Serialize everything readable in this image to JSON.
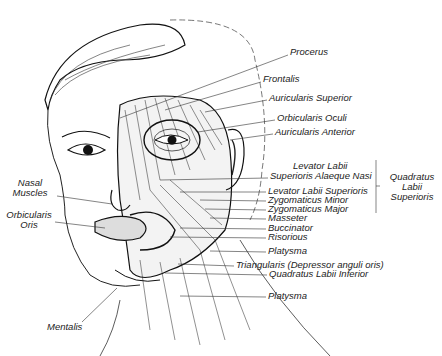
{
  "diagram": {
    "labels_right": [
      {
        "id": "procerus",
        "text": "Procerus",
        "x": 290,
        "y": 50
      },
      {
        "id": "frontalis",
        "text": "Frontalis",
        "x": 263,
        "y": 77
      },
      {
        "id": "auricularis-superior",
        "text": "Auricularis Superior",
        "x": 269,
        "y": 95
      },
      {
        "id": "orbicularis-oculi",
        "text": "Orbicularis Oculi",
        "x": 277,
        "y": 115
      },
      {
        "id": "auricularis-anterior",
        "text": "Auricularis Anterior",
        "x": 275,
        "y": 129
      },
      {
        "id": "levator-labii-line1",
        "text": "Levator Labii",
        "x": 293,
        "y": 163
      },
      {
        "id": "levator-labii-line2",
        "text": "Superioris Alaeque Nasi",
        "x": 270,
        "y": 173
      },
      {
        "id": "levator-labii-superioris",
        "text": "Levator Labii Superioris",
        "x": 268,
        "y": 188
      },
      {
        "id": "zygomaticus-minor",
        "text": "Zygomaticus Minor",
        "x": 268,
        "y": 197
      },
      {
        "id": "zygomaticus-major",
        "text": "Zygomaticus Major",
        "x": 268,
        "y": 206
      },
      {
        "id": "masseter",
        "text": "Masseter",
        "x": 268,
        "y": 215
      },
      {
        "id": "buccinator",
        "text": "Buccinator",
        "x": 268,
        "y": 225
      },
      {
        "id": "risorious",
        "text": "Risorious",
        "x": 268,
        "y": 234
      },
      {
        "id": "platysma-upper",
        "text": "Platysma",
        "x": 268,
        "y": 248
      },
      {
        "id": "triangularis",
        "text": "Triangularis (Depressor anguli oris)",
        "x": 236,
        "y": 262
      },
      {
        "id": "quadratus-labii-inferior",
        "text": "Quadratus Labii Inferior",
        "x": 269,
        "y": 271
      },
      {
        "id": "platysma-lower",
        "text": "Platysma",
        "x": 268,
        "y": 293
      }
    ],
    "group_label": {
      "lines": [
        "Quadratus",
        "Labii",
        "Superioris"
      ]
    },
    "labels_left": {
      "nasal_muscles": [
        "Nasal",
        "Muscles"
      ],
      "orbicularis_oris": [
        "Orbicularis",
        "Oris"
      ],
      "mentalis": "Mentalis"
    }
  }
}
